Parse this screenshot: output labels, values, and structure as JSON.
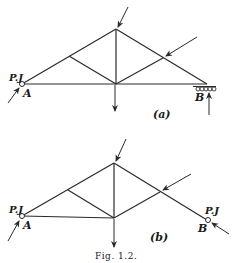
{
  "figure": {
    "caption": "Fig. 1.2.",
    "truss_a": {
      "sublabel": "(a)",
      "support_left_label": "P.J",
      "node_left": "A",
      "node_right": "B"
    },
    "truss_b": {
      "sublabel": "(b)",
      "support_left_label": "P.J",
      "support_right_label": "P.J",
      "node_left": "A",
      "node_right": "B"
    }
  }
}
